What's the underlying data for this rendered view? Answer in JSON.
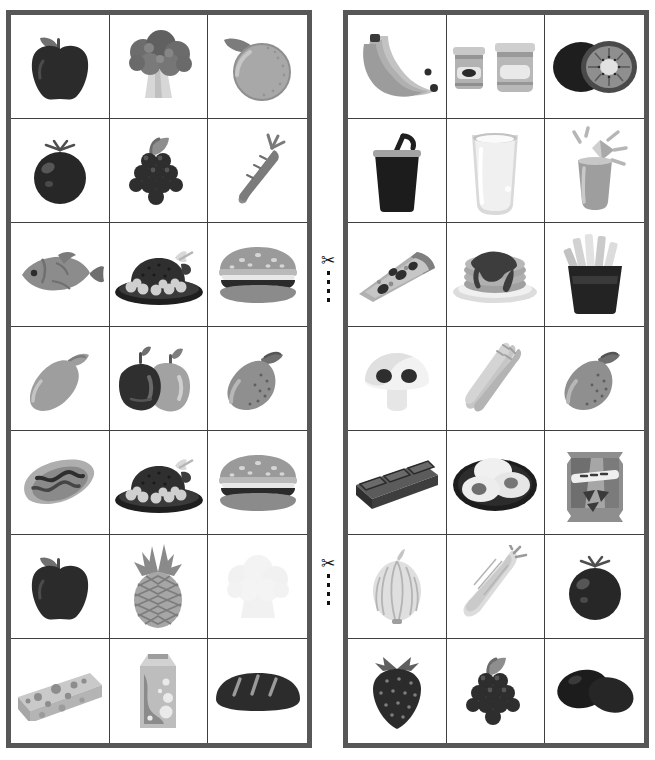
{
  "worksheet": {
    "title": "Food Picture Cards",
    "type": "cut-out picture card sheet",
    "panels": 2,
    "columns": 3,
    "rows": 7,
    "border_color": "#575757",
    "grid_line_color": "#3f3f3f",
    "background_color": "#ffffff"
  },
  "cut_marks": [
    {
      "name": "cut-mark-1",
      "icon": "scissors-icon",
      "glyph": "✂",
      "dash_line": true
    },
    {
      "name": "cut-mark-2",
      "icon": "scissors-icon",
      "glyph": "✂",
      "dash_line": true
    }
  ],
  "left_panel": {
    "name": "left-card-grid",
    "cells": [
      {
        "row": 1,
        "col": 1,
        "item": "apple",
        "label": "Apple",
        "icon": "apple-icon"
      },
      {
        "row": 1,
        "col": 2,
        "item": "broccoli",
        "label": "Broccoli",
        "icon": "broccoli-icon"
      },
      {
        "row": 1,
        "col": 3,
        "item": "orange",
        "label": "Orange",
        "icon": "orange-icon"
      },
      {
        "row": 2,
        "col": 1,
        "item": "tomato",
        "label": "Tomato",
        "icon": "tomato-icon"
      },
      {
        "row": 2,
        "col": 2,
        "item": "grapes",
        "label": "Grapes",
        "icon": "grapes-icon"
      },
      {
        "row": 2,
        "col": 3,
        "item": "carrot",
        "label": "Carrot",
        "icon": "carrot-icon"
      },
      {
        "row": 3,
        "col": 1,
        "item": "fish",
        "label": "Fish",
        "icon": "fish-icon"
      },
      {
        "row": 3,
        "col": 2,
        "item": "roast_turkey",
        "label": "Roast turkey",
        "icon": "roast-turkey-icon"
      },
      {
        "row": 3,
        "col": 3,
        "item": "hamburger",
        "label": "Hamburger",
        "icon": "hamburger-icon"
      },
      {
        "row": 4,
        "col": 1,
        "item": "lemon",
        "label": "Lemon",
        "icon": "lemon-icon"
      },
      {
        "row": 4,
        "col": 2,
        "item": "bell_peppers",
        "label": "Bell peppers",
        "icon": "bell-pepper-icon"
      },
      {
        "row": 4,
        "col": 3,
        "item": "mango",
        "label": "Mango",
        "icon": "mango-icon"
      },
      {
        "row": 5,
        "col": 1,
        "item": "hot_dog",
        "label": "Hot dog",
        "icon": "hot-dog-icon"
      },
      {
        "row": 5,
        "col": 2,
        "item": "roast_turkey",
        "label": "Roast turkey",
        "icon": "roast-turkey-icon"
      },
      {
        "row": 5,
        "col": 3,
        "item": "cheeseburger",
        "label": "Cheeseburger",
        "icon": "hamburger-icon"
      },
      {
        "row": 6,
        "col": 1,
        "item": "apple",
        "label": "Apple",
        "icon": "apple-icon"
      },
      {
        "row": 6,
        "col": 2,
        "item": "pineapple",
        "label": "Pineapple",
        "icon": "pineapple-icon"
      },
      {
        "row": 6,
        "col": 3,
        "item": "cauliflower",
        "label": "Cauliflower",
        "icon": "cauliflower-icon"
      },
      {
        "row": 7,
        "col": 1,
        "item": "cheese",
        "label": "Cheese",
        "icon": "cheese-icon"
      },
      {
        "row": 7,
        "col": 2,
        "item": "milk_carton",
        "label": "Milk carton",
        "icon": "milk-carton-icon"
      },
      {
        "row": 7,
        "col": 3,
        "item": "bread",
        "label": "Bread loaf",
        "icon": "bread-icon"
      }
    ]
  },
  "right_panel": {
    "name": "right-card-grid",
    "cells": [
      {
        "row": 1,
        "col": 1,
        "item": "bananas",
        "label": "Bananas",
        "icon": "bananas-icon"
      },
      {
        "row": 1,
        "col": 2,
        "item": "jam_jars",
        "label": "Jam jars",
        "icon": "jam-jar-icon"
      },
      {
        "row": 1,
        "col": 3,
        "item": "kiwi",
        "label": "Kiwi",
        "icon": "kiwi-icon"
      },
      {
        "row": 2,
        "col": 1,
        "item": "soda_cup",
        "label": "Soda cup",
        "icon": "soda-cup-icon"
      },
      {
        "row": 2,
        "col": 2,
        "item": "glass_of_milk",
        "label": "Glass of milk",
        "icon": "milk-glass-icon"
      },
      {
        "row": 2,
        "col": 3,
        "item": "juice",
        "label": "Juice",
        "icon": "juice-glass-icon"
      },
      {
        "row": 3,
        "col": 1,
        "item": "pizza_slice",
        "label": "Pizza slice",
        "icon": "pizza-slice-icon"
      },
      {
        "row": 3,
        "col": 2,
        "item": "pancakes",
        "label": "Pancakes",
        "icon": "pancakes-icon"
      },
      {
        "row": 3,
        "col": 3,
        "item": "french_fries",
        "label": "French fries",
        "icon": "fries-icon"
      },
      {
        "row": 4,
        "col": 1,
        "item": "mushroom",
        "label": "Mushroom",
        "icon": "mushroom-icon"
      },
      {
        "row": 4,
        "col": 2,
        "item": "asparagus",
        "label": "Asparagus",
        "icon": "asparagus-icon"
      },
      {
        "row": 4,
        "col": 3,
        "item": "mango",
        "label": "Mango",
        "icon": "mango-icon"
      },
      {
        "row": 5,
        "col": 1,
        "item": "chocolate_bar",
        "label": "Chocolate bar",
        "icon": "chocolate-bar-icon"
      },
      {
        "row": 5,
        "col": 2,
        "item": "fried_eggs",
        "label": "Fried eggs",
        "icon": "fried-eggs-icon"
      },
      {
        "row": 5,
        "col": 3,
        "item": "chips_bag",
        "label": "Bag of chips",
        "icon": "chips-bag-icon"
      },
      {
        "row": 6,
        "col": 1,
        "item": "onion",
        "label": "Onion",
        "icon": "onion-icon"
      },
      {
        "row": 6,
        "col": 2,
        "item": "corn",
        "label": "Corn",
        "icon": "corn-icon"
      },
      {
        "row": 6,
        "col": 3,
        "item": "tomato",
        "label": "Tomato",
        "icon": "tomato-icon"
      },
      {
        "row": 7,
        "col": 1,
        "item": "strawberry",
        "label": "Strawberry",
        "icon": "strawberry-icon"
      },
      {
        "row": 7,
        "col": 2,
        "item": "grapes",
        "label": "Grapes",
        "icon": "grapes-icon"
      },
      {
        "row": 7,
        "col": 3,
        "item": "olives",
        "label": "Olives",
        "icon": "olives-icon"
      }
    ]
  }
}
